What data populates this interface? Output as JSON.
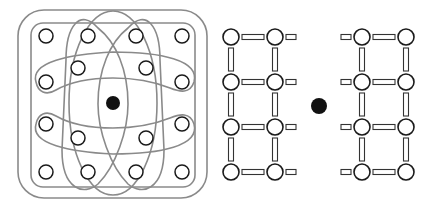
{
  "figure": {
    "width": 434,
    "height": 207,
    "colors": {
      "loop_stroke": "#8a8a8a",
      "site_stroke": "#1a1a1a",
      "site_fill": "#ffffff",
      "center_fill": "#111111",
      "bond_stroke": "#333333"
    },
    "panel_left": {
      "description": "Lattice sites grouped by overlapping loops around a central filled site",
      "center_dot": {
        "cx": 113,
        "cy": 103,
        "r": 7
      },
      "outer_rect": {
        "x": 18,
        "y": 10,
        "w": 189,
        "h": 188,
        "rx": 26
      },
      "inner_rect": {
        "x": 31,
        "y": 23,
        "w": 164,
        "h": 164,
        "rx": 12
      },
      "sites": [
        {
          "cx": 46,
          "cy": 36
        },
        {
          "cx": 88,
          "cy": 36
        },
        {
          "cx": 136,
          "cy": 36
        },
        {
          "cx": 182,
          "cy": 36
        },
        {
          "cx": 78,
          "cy": 68
        },
        {
          "cx": 146,
          "cy": 68
        },
        {
          "cx": 46,
          "cy": 82
        },
        {
          "cx": 182,
          "cy": 82
        },
        {
          "cx": 46,
          "cy": 124
        },
        {
          "cx": 182,
          "cy": 124
        },
        {
          "cx": 78,
          "cy": 138
        },
        {
          "cx": 146,
          "cy": 138
        },
        {
          "cx": 46,
          "cy": 172
        },
        {
          "cx": 88,
          "cy": 172
        },
        {
          "cx": 136,
          "cy": 172
        },
        {
          "cx": 182,
          "cy": 172
        }
      ],
      "site_radius": 7
    },
    "panel_right": {
      "description": "Two ladder lattices separated by a central filled site",
      "center_dot": {
        "cx": 319,
        "cy": 106,
        "r": 8
      },
      "left_lattice_x": [
        231,
        275
      ],
      "right_lattice_x": [
        362,
        406
      ],
      "rows_y": [
        37,
        82,
        127,
        172
      ],
      "site_radius": 8
    }
  }
}
